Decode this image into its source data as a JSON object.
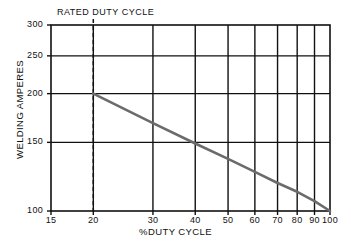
{
  "chart_data": {
    "type": "line",
    "title": "",
    "annotation": "RATED DUTY CYCLE",
    "xlabel": "%DUTY CYCLE",
    "ylabel": "WELDING AMPERES",
    "xscale": "log",
    "yscale": "log",
    "xlim": [
      15,
      100
    ],
    "ylim": [
      100,
      300
    ],
    "xticks": [
      15,
      20,
      30,
      40,
      50,
      60,
      70,
      80,
      90,
      100
    ],
    "xtick_labels": [
      "15",
      "20",
      "30",
      "40",
      "50",
      "60",
      "70",
      "80",
      "90",
      "100"
    ],
    "yticks": [
      100,
      150,
      200,
      250,
      300
    ],
    "ytick_labels": [
      "100",
      "150",
      "200",
      "250",
      "300"
    ],
    "grid": true,
    "legend": null,
    "series": [
      {
        "name": "Duty cycle derating curve",
        "color": "#6b6b6b",
        "x": [
          20,
          30,
          40,
          50,
          60,
          70,
          80,
          90,
          100
        ],
        "y": [
          200,
          168,
          149,
          136,
          126,
          118,
          112,
          106,
          100
        ]
      }
    ],
    "reference_lines": [
      {
        "name": "rated-duty-cycle",
        "orientation": "vertical",
        "value": 20,
        "style": "dashed",
        "label": "RATED DUTY CYCLE"
      }
    ],
    "notable_points": [
      {
        "x": 20,
        "y": 200,
        "note": "rated duty cycle point"
      },
      {
        "x": 40,
        "y": 150,
        "note": "curve crosses 150 A gridline"
      },
      {
        "x": 100,
        "y": 100,
        "note": "100% duty cycle rating"
      }
    ]
  },
  "axes": {
    "y_ticks": [
      {
        "label": "300",
        "pos": 25
      },
      {
        "label": "250",
        "pos": 70
      },
      {
        "label": "200",
        "pos": 96
      },
      {
        "label": "150",
        "pos": 148
      },
      {
        "label": "100",
        "pos": 211
      }
    ],
    "x_ticks": [
      {
        "label": "15",
        "pos": 51
      },
      {
        "label": "20",
        "pos": 105
      },
      {
        "label": "30",
        "pos": 170
      },
      {
        "label": "40",
        "pos": 211
      },
      {
        "label": "50",
        "pos": 243
      },
      {
        "label": "60",
        "pos": 269
      },
      {
        "label": "70",
        "pos": 291
      },
      {
        "label": "80",
        "pos": 310
      },
      {
        "label": "90",
        "pos": 327
      },
      {
        "label": "100",
        "pos": 337
      }
    ]
  },
  "colors": {
    "axis": "#111111",
    "grid": "#111111",
    "curve": "#6b6b6b",
    "dashed": "#111111",
    "background": "#ffffff"
  }
}
